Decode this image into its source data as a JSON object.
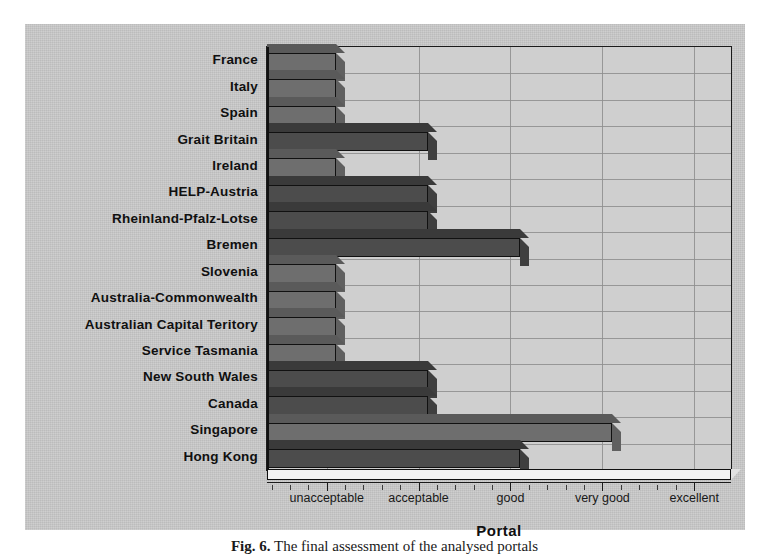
{
  "figure": {
    "caption_label": "Fig. 6.",
    "caption_text": " The final assessment of the analysed portals"
  },
  "chart_data": {
    "type": "bar",
    "orientation": "horizontal",
    "title": "",
    "xlabel": "Portal",
    "ylabel": "",
    "grid": true,
    "legend": "none",
    "xtick_labels": [
      "unacceptable",
      "acceptable",
      "good",
      "very good",
      "excellent"
    ],
    "xtick_values": [
      1,
      2,
      3,
      4,
      5
    ],
    "xlim": [
      0.35,
      5.4
    ],
    "categories": [
      "France",
      "Italy",
      "Spain",
      "Grait Britain",
      "Ireland",
      "HELP-Austria",
      "Rheinland-Pfalz-Lotse",
      "Bremen",
      "Slovenia",
      "Australia-Commonwealth",
      "Australian Capital Teritory",
      "Service Tasmania",
      "New South Wales",
      "Canada",
      "Singapore",
      "Hong Kong"
    ],
    "values": [
      1.1,
      1.1,
      1.1,
      2.1,
      1.1,
      2.1,
      2.1,
      3.1,
      1.1,
      1.1,
      1.1,
      1.1,
      2.1,
      2.1,
      4.1,
      3.1
    ],
    "value_labels": [
      "unacceptable",
      "unacceptable",
      "unacceptable",
      "acceptable",
      "unacceptable",
      "acceptable",
      "acceptable",
      "good",
      "unacceptable",
      "unacceptable",
      "unacceptable",
      "unacceptable",
      "acceptable",
      "acceptable",
      "very good",
      "good"
    ],
    "bar_shade": [
      "light",
      "light",
      "light",
      "dark",
      "light",
      "dark",
      "dark",
      "dark",
      "light",
      "light",
      "light",
      "light",
      "dark",
      "dark",
      "light",
      "dark"
    ],
    "colors": {
      "bar_dark": "#4c4c4c",
      "bar_light": "#6e6e6e",
      "plot_background": "#cfcfcf",
      "page_background": "#c9c9c9",
      "axis": "#1b1b1b",
      "gridline": "#8d8d8d",
      "text": "#101010"
    }
  }
}
